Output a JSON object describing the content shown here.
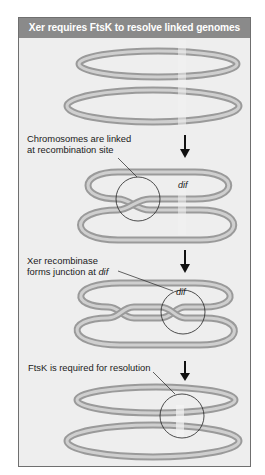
{
  "figure": {
    "title": "Xer requires FtsK to resolve linked genomes",
    "colors": {
      "header_bg": "#8a8a8a",
      "panel_bg": "#eeeeee",
      "ring_outer": "#9a9a9a",
      "ring_inner": "#cfcfcf",
      "dif_highlight": "#f4f4f4",
      "arrow": "#111111"
    },
    "stages": [
      {
        "id": "unlinked",
        "label": null
      },
      {
        "id": "linked",
        "label_line1": "Chromosomes are linked",
        "label_line2": "at recombination site",
        "site_label": "dif"
      },
      {
        "id": "junction",
        "label_line1": "Xer recombinase",
        "label_line2_prefix": "forms junction at ",
        "label_line2_italic": "dif",
        "site_label": "dif"
      },
      {
        "id": "resolution",
        "label_line1": "FtsK is required for resolution"
      }
    ],
    "arrows": [
      {
        "from": "linked",
        "icon": "down-arrow-icon"
      },
      {
        "from": "junction",
        "icon": "down-arrow-icon"
      },
      {
        "from": "resolution",
        "icon": "down-arrow-icon"
      }
    ]
  }
}
